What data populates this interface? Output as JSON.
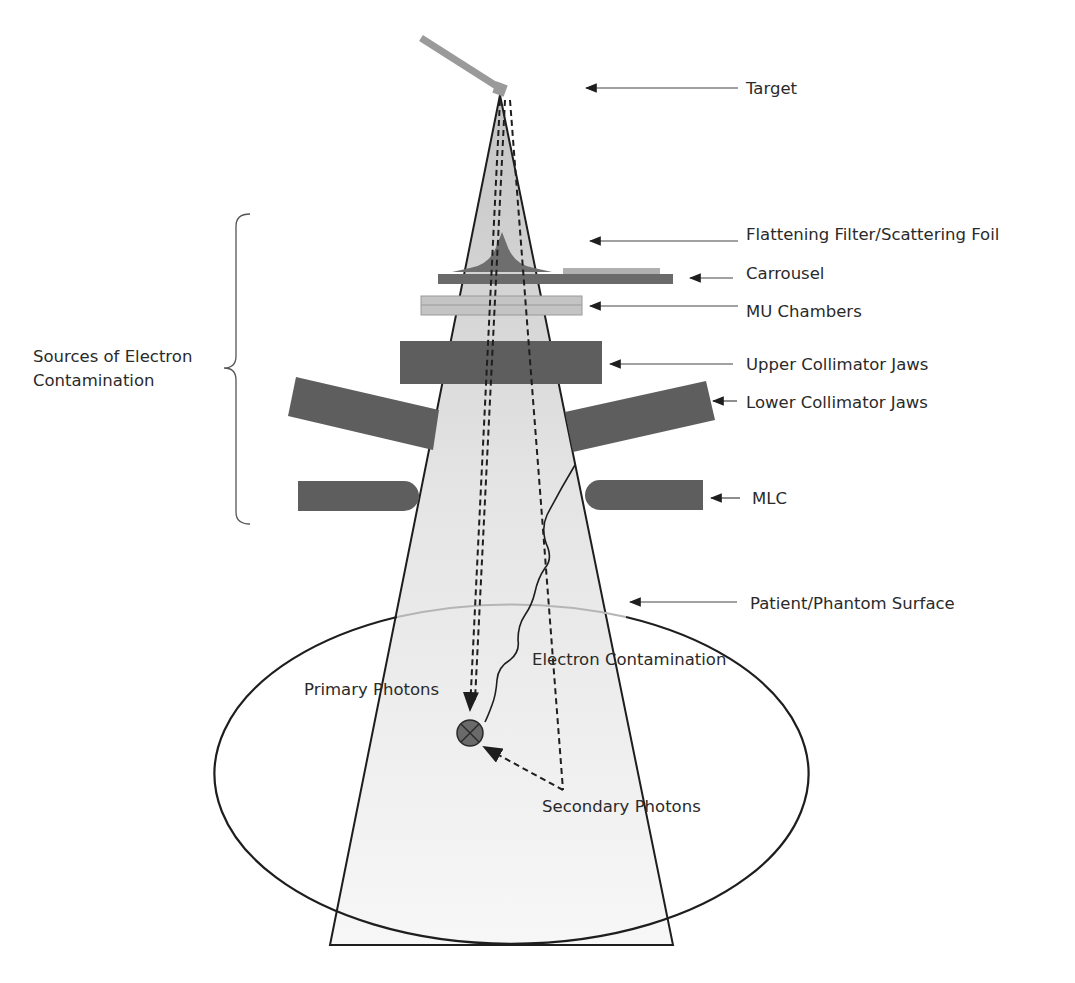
{
  "colors": {
    "background": "#ffffff",
    "beam_fill": "#e6e6e6",
    "beam_fill_top": "#c9c9c9",
    "component_dark": "#5e5e5e",
    "component_light": "#bdbdbd",
    "target_arm": "#9a9a9a",
    "outline": "#1e1e1e",
    "text": "#2a2a2a",
    "surface_line": "#b5b5b5"
  },
  "labels": {
    "target": "Target",
    "flattening_filter": "Flattening Filter/Scattering Foil",
    "carrousel": "Carrousel",
    "mu_chambers": "MU Chambers",
    "upper_jaws": "Upper Collimator Jaws",
    "lower_jaws": "Lower Collimator Jaws",
    "mlc": "MLC",
    "patient_surface": "Patient/Phantom Surface",
    "sources_line1": "Sources of Electron",
    "sources_line2": "Contamination",
    "electron_contamination": "Electron Contamination",
    "primary_photons": "Primary Photons",
    "secondary_photons": "Secondary Photons"
  },
  "icons": {
    "interaction_point": "circle-x-icon"
  }
}
